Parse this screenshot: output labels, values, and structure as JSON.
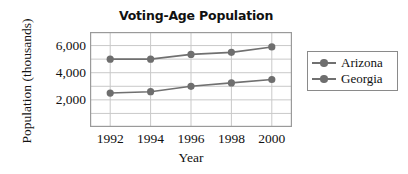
{
  "chart_data": {
    "type": "line",
    "title": "Voting-Age Population",
    "xlabel": "Year",
    "ylabel": "Population (thousands)",
    "x": [
      1992,
      1994,
      1996,
      1998,
      2000
    ],
    "xtick_labels": [
      "1992",
      "1994",
      "1996",
      "1998",
      "2000"
    ],
    "ytick_labels": [
      "2,000",
      "4,000",
      "6,000"
    ],
    "ytick_values": [
      2000,
      4000,
      6000
    ],
    "ylim": [
      0,
      7000
    ],
    "xlim": [
      1991,
      2001
    ],
    "grid": true,
    "grid_interval": 1000,
    "legend_position": "right",
    "series": [
      {
        "name": "Arizona",
        "values": [
          2500,
          2600,
          3000,
          3250,
          3500
        ],
        "color": "#707070",
        "marker": "circle"
      },
      {
        "name": "Georgia",
        "values": [
          5000,
          5000,
          5350,
          5500,
          5900
        ],
        "color": "#707070",
        "marker": "circle"
      }
    ]
  },
  "legend": {
    "entries": [
      {
        "label": "Arizona"
      },
      {
        "label": "Georgia"
      }
    ]
  },
  "colors": {
    "series_line": "#707070",
    "marker": "#6e6e6e",
    "grid": "#c9c9c9",
    "axis_border": "#9a9a9a",
    "text": "#111111",
    "background": "#ffffff"
  }
}
